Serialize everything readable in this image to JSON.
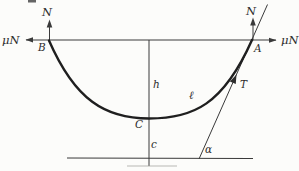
{
  "figure": {
    "background_color": "#fcfcfa",
    "line_color": "#3a3a3a",
    "curve_color": "#1f1f1f",
    "label_color": "#2d2d2d",
    "labels": {
      "normal_left": "N",
      "friction_left": "μN",
      "point_b": "B",
      "normal_right": "N",
      "friction_right": "μN",
      "point_a": "A",
      "sag_height": "h",
      "point_c": "C",
      "clearance": "c",
      "cable_length": "ℓ",
      "tension": "T",
      "angle": "α"
    }
  }
}
